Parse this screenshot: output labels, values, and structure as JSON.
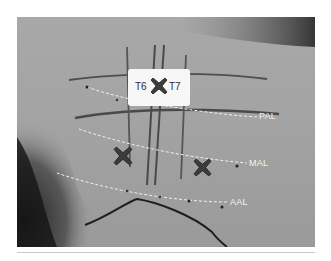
{
  "figure": {
    "vertebra_labels": [
      "T6",
      "T7"
    ],
    "line_labels": {
      "posterior": "PAL",
      "mid": "MAL",
      "anterior": "AAL"
    },
    "marker_count": 3,
    "colors": {
      "skin": "#a6a6a6",
      "shadow": "#2c2c2c",
      "marker": "#3c3c3c",
      "dashed_line": "#f0f0f0",
      "box": "#f7f7f7"
    }
  }
}
